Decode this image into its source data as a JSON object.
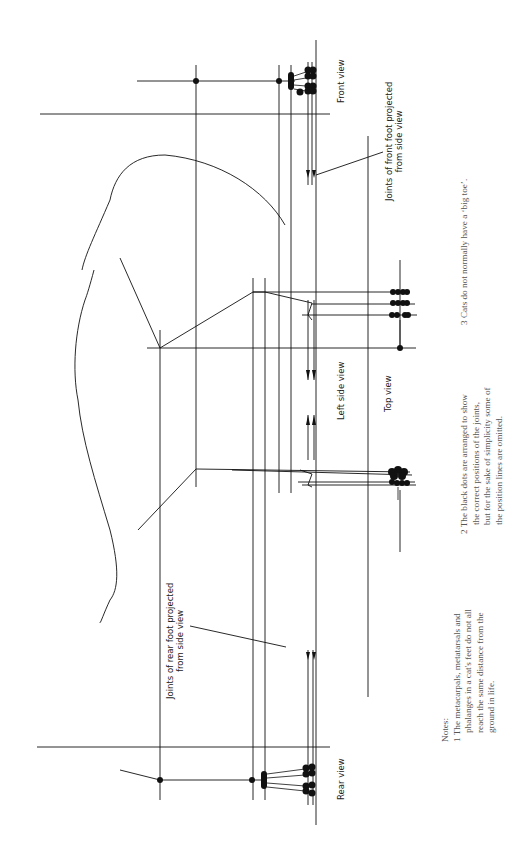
{
  "labels": {
    "front_view": "Front view",
    "left_side_view": "Left side view",
    "top_view": "Top view",
    "rear_view": "Rear view",
    "front_joints_line1": "Joints of front foot projected",
    "front_joints_line2": "from side view",
    "rear_joints_line1": "Joints of rear foot projected",
    "rear_joints_line2": "from side view"
  },
  "notes": {
    "heading": "Notes:",
    "note1": {
      "line1": "1 The metacarpals, metatarsals and",
      "line2": "phalanges in a cat's feet do not all",
      "line3": "reach the same distance from the",
      "line4": "ground in life."
    },
    "note2": {
      "line1": "2 The black dots are arranged to show",
      "line2": "the correct positions of the joints,",
      "line3": "but for the sake of simplicity some of",
      "line4": "the position lines are omitted."
    },
    "note3": {
      "line1": "3 Cats do not normally have a ‘big toe’."
    }
  },
  "colors": {
    "ink": "#111111",
    "note_text": "#555555",
    "background": "#ffffff"
  }
}
